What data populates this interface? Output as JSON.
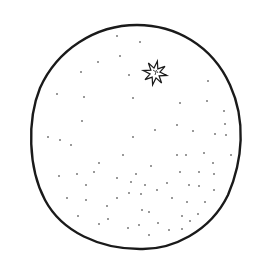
{
  "drawing": {
    "subject": "orange",
    "stroke_color": "#1a1a1a",
    "background": "#ffffff",
    "outline": {
      "cx": 135,
      "cy": 137,
      "rx": 106,
      "ry": 112
    },
    "stem": {
      "cx": 155,
      "cy": 73,
      "r_outer": 12,
      "r_inner": 5,
      "points": 8
    },
    "dots": [
      [
        117,
        36
      ],
      [
        140,
        42
      ],
      [
        98,
        62
      ],
      [
        120,
        56
      ],
      [
        81,
        72
      ],
      [
        129,
        75
      ],
      [
        208,
        81
      ],
      [
        57,
        94
      ],
      [
        84,
        97
      ],
      [
        133,
        98
      ],
      [
        180,
        103
      ],
      [
        207,
        101
      ],
      [
        224,
        111
      ],
      [
        82,
        121
      ],
      [
        177,
        125
      ],
      [
        225,
        124
      ],
      [
        155,
        130
      ],
      [
        193,
        131
      ],
      [
        215,
        134
      ],
      [
        226,
        135
      ],
      [
        48,
        137
      ],
      [
        60,
        140
      ],
      [
        71,
        145
      ],
      [
        133,
        137
      ],
      [
        123,
        155
      ],
      [
        177,
        155
      ],
      [
        186,
        155
      ],
      [
        204,
        153
      ],
      [
        231,
        155
      ],
      [
        99,
        163
      ],
      [
        213,
        163
      ],
      [
        151,
        166
      ],
      [
        59,
        176
      ],
      [
        77,
        174
      ],
      [
        94,
        172
      ],
      [
        136,
        174
      ],
      [
        117,
        178
      ],
      [
        180,
        172
      ],
      [
        199,
        172
      ],
      [
        214,
        174
      ],
      [
        86,
        185
      ],
      [
        131,
        182
      ],
      [
        145,
        185
      ],
      [
        167,
        183
      ],
      [
        189,
        185
      ],
      [
        199,
        186
      ],
      [
        129,
        193
      ],
      [
        141,
        194
      ],
      [
        157,
        190
      ],
      [
        214,
        190
      ],
      [
        67,
        198
      ],
      [
        86,
        200
      ],
      [
        117,
        198
      ],
      [
        172,
        198
      ],
      [
        187,
        202
      ],
      [
        205,
        202
      ],
      [
        107,
        206
      ],
      [
        142,
        210
      ],
      [
        149,
        212
      ],
      [
        182,
        216
      ],
      [
        78,
        216
      ],
      [
        108,
        219
      ],
      [
        198,
        214
      ],
      [
        190,
        221
      ],
      [
        99,
        224
      ],
      [
        158,
        223
      ],
      [
        128,
        228
      ],
      [
        139,
        225
      ],
      [
        169,
        230
      ],
      [
        182,
        229
      ],
      [
        149,
        235
      ]
    ]
  }
}
